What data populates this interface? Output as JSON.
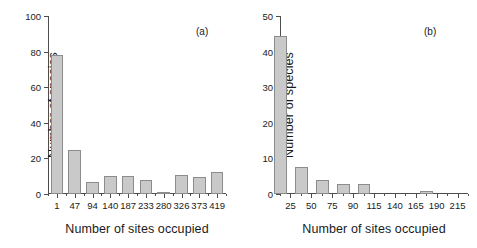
{
  "figure": {
    "panels": [
      {
        "tag": "(a)",
        "xlabel": "Number of sites occupied",
        "ylabel": "Number of species"
      },
      {
        "tag": "(b)",
        "xlabel": "Number of sites occupied",
        "ylabel": "Number of species"
      }
    ]
  },
  "chart_data": [
    {
      "type": "bar",
      "title": "",
      "panel": "(a)",
      "xlabel": "Number of sites occupied",
      "ylabel": "Number of species",
      "categories": [
        "1",
        "47",
        "94",
        "140",
        "187",
        "233",
        "280",
        "326",
        "373",
        "419"
      ],
      "values": [
        78,
        25,
        6.5,
        10,
        10,
        7.8,
        1.2,
        10.6,
        9.5,
        12.6
      ],
      "ylim": [
        0,
        100
      ],
      "yticks": [
        0,
        20,
        40,
        60,
        80,
        100
      ],
      "grid": false,
      "legend": "none"
    },
    {
      "type": "bar",
      "title": "",
      "panel": "(b)",
      "xlabel": "Number of sites occupied",
      "ylabel": "Number of species",
      "categories": [
        "25",
        "50",
        "75",
        "90",
        "115",
        "140",
        "165",
        "190",
        "215"
      ],
      "values": [
        44.5,
        7.7,
        4.0,
        2.9,
        2.7,
        0,
        0,
        0.8,
        0
      ],
      "ylim": [
        0,
        50
      ],
      "yticks": [
        0,
        10,
        20,
        30,
        40,
        50
      ],
      "grid": false,
      "legend": "none"
    }
  ],
  "axis_a": {
    "yticks": [
      "0",
      "20",
      "40",
      "60",
      "80",
      "100"
    ],
    "xticks": [
      "1",
      "47",
      "94",
      "140",
      "187",
      "233",
      "280",
      "326",
      "373",
      "419"
    ]
  },
  "axis_b": {
    "yticks": [
      "0",
      "10",
      "20",
      "30",
      "40",
      "50"
    ],
    "xticks": [
      "25",
      "50",
      "75",
      "90",
      "115",
      "140",
      "165",
      "190",
      "215"
    ]
  },
  "colors": {
    "bar_fill": "#c9c9c9",
    "bar_stroke": "#8c8c8c",
    "axis": "#4d4d4d",
    "text": "#1a1a1a",
    "background": "#ffffff"
  }
}
